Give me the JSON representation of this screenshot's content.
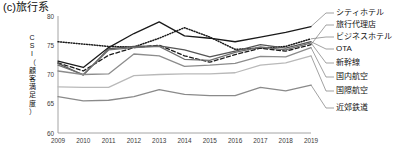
{
  "panel": {
    "title": "(c)旅行系"
  },
  "axes": {
    "ylabel_chars": [
      "C",
      "S",
      "I",
      "（",
      "顧",
      "客",
      "満",
      "足",
      "度",
      "）"
    ],
    "ylabel": "CSI（顧客満足度）",
    "yticks": [
      "80",
      "75",
      "70",
      "65",
      "60"
    ],
    "xticks": [
      "2009",
      "2010",
      "2011",
      "2012",
      "2013",
      "2014",
      "2015",
      "2016",
      "2017",
      "2018",
      "2019"
    ]
  },
  "legend": {
    "items": [
      {
        "label": "シティホテル",
        "style": "solid",
        "color": "#1a1a1a",
        "width": 1.3
      },
      {
        "label": "旅行代理店",
        "style": "dashed",
        "color": "#1a1a1a",
        "width": 1.3
      },
      {
        "label": "ビジネスホテル",
        "style": "dotted",
        "color": "#1a1a1a",
        "width": 1.5
      },
      {
        "label": "OTA",
        "style": "solid",
        "color": "#555555",
        "width": 1.3
      },
      {
        "label": "新幹線",
        "style": "solid",
        "color": "#6f6f6f",
        "width": 1.3
      },
      {
        "label": "国内航空",
        "style": "solid",
        "color": "#8c8c8c",
        "width": 1.3
      },
      {
        "label": "国際航空",
        "style": "solid",
        "color": "#b9b9b9",
        "width": 1.3
      },
      {
        "label": "近郊鉄道",
        "style": "solid",
        "color": "#8a8a8a",
        "width": 1.3
      }
    ]
  },
  "chart_data": {
    "type": "line",
    "title": "(c)旅行系",
    "xlabel": "",
    "ylabel": "CSI（顧客満足度）",
    "x": [
      2009,
      2010,
      2011,
      2012,
      2013,
      2014,
      2015,
      2016,
      2017,
      2018,
      2019
    ],
    "xlim": [
      2009,
      2019
    ],
    "ylim": [
      60,
      80
    ],
    "yticks": [
      60,
      65,
      70,
      75,
      80
    ],
    "grid": false,
    "legend_position": "right",
    "series": [
      {
        "name": "シティホテル",
        "style": "solid",
        "color": "#1a1a1a",
        "values": [
          72.3,
          71.2,
          74.6,
          77.0,
          79.0,
          76.6,
          76.2,
          75.6,
          76.4,
          77.2,
          78.2
        ]
      },
      {
        "name": "旅行代理店",
        "style": "dashed",
        "color": "#1a1a1a",
        "values": [
          72.0,
          70.6,
          73.3,
          74.6,
          75.0,
          73.2,
          72.1,
          73.4,
          74.5,
          74.0,
          75.1
        ]
      },
      {
        "name": "ビジネスホテル",
        "style": "dotted",
        "color": "#1a1a1a",
        "values": [
          75.6,
          75.2,
          74.8,
          74.7,
          76.2,
          78.0,
          76.4,
          74.3,
          74.5,
          74.8,
          76.1
        ]
      },
      {
        "name": "OTA",
        "style": "solid",
        "color": "#555555",
        "values": [
          71.9,
          69.9,
          74.4,
          74.8,
          74.9,
          74.2,
          73.0,
          74.0,
          75.1,
          74.5,
          75.6
        ]
      },
      {
        "name": "新幹線",
        "style": "solid",
        "color": "#6f6f6f",
        "values": [
          71.6,
          70.0,
          74.2,
          74.6,
          74.8,
          72.6,
          72.4,
          73.8,
          74.7,
          74.2,
          75.4
        ]
      },
      {
        "name": "国内航空",
        "style": "solid",
        "color": "#8c8c8c",
        "values": [
          70.6,
          70.0,
          70.1,
          73.5,
          73.2,
          71.4,
          71.6,
          71.9,
          73.1,
          73.0,
          74.6
        ]
      },
      {
        "name": "国際航空",
        "style": "solid",
        "color": "#b9b9b9",
        "values": [
          67.9,
          67.8,
          67.8,
          69.8,
          70.0,
          70.1,
          70.1,
          70.3,
          71.6,
          72.0,
          73.2
        ]
      },
      {
        "name": "近郊鉄道",
        "style": "solid",
        "color": "#8a8a8a",
        "values": [
          66.2,
          65.5,
          65.6,
          66.2,
          67.4,
          66.6,
          66.4,
          66.4,
          67.8,
          67.2,
          68.2
        ]
      }
    ]
  }
}
